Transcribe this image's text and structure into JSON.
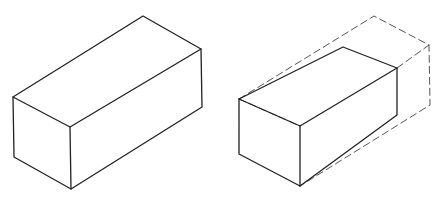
{
  "figure": {
    "colors": {
      "stroke": "#222222",
      "dashed_stroke": "#555555",
      "background": "#ffffff"
    },
    "left_box": {
      "vertices": {
        "front_top_left": [
          13,
          97
        ],
        "front_top_right": [
          70,
          127
        ],
        "back_top_left": [
          143,
          16
        ],
        "back_top_right": [
          201,
          49
        ],
        "front_bottom_left": [
          14,
          157
        ],
        "front_bottom_right": [
          71,
          189
        ],
        "back_bottom_right": [
          202,
          107
        ]
      }
    },
    "right_box": {
      "vertices": {
        "front_top_left": [
          239,
          99
        ],
        "front_top_right": [
          300,
          126
        ],
        "back_top_left": [
          343,
          47
        ],
        "back_top_right": [
          397,
          68
        ],
        "front_bottom_left": [
          239,
          154
        ],
        "front_bottom_right": [
          300,
          186
        ],
        "back_bottom_right": [
          397,
          115
        ]
      },
      "dashed_outline": {
        "back_top_left": [
          374,
          16
        ],
        "back_top_right": [
          429,
          45
        ],
        "back_bottom_right": [
          430,
          105
        ]
      }
    }
  }
}
